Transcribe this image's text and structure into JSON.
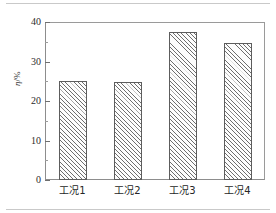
{
  "figure": {
    "background_color": "#ffffff",
    "frame_color": "#8d8d8d"
  },
  "chart_data": {
    "type": "bar",
    "title": "",
    "xlabel": "",
    "ylabel": "η/%",
    "categories": [
      "工况1",
      "工况2",
      "工况3",
      "工况4"
    ],
    "values": [
      25.0,
      24.8,
      37.5,
      34.7
    ],
    "ylim": [
      0,
      40
    ],
    "yticks": [
      0,
      10,
      20,
      30,
      40
    ],
    "ytick_labels": [
      "0",
      "10",
      "20",
      "30",
      "40"
    ],
    "yminor_ticks": [
      5,
      15,
      25,
      35
    ],
    "grid": false,
    "legend": null,
    "bar_style": {
      "fill": "#fdfdfd",
      "edge": "#5d5d5d",
      "hatch": "///"
    }
  },
  "axis": {
    "y_title_symbol": "η",
    "y_title_unit": "/%",
    "tick_label_0": "0",
    "tick_label_10": "10",
    "tick_label_20": "20",
    "tick_label_30": "30",
    "tick_label_40": "40"
  },
  "xaxis": {
    "labels": [
      "工况1",
      "工况2",
      "工况3",
      "工况4"
    ]
  }
}
